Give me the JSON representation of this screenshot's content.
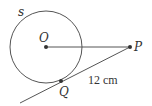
{
  "diagram": {
    "type": "geometry-tangent",
    "colors": {
      "stroke": "#555555",
      "point": "#333333",
      "text": "#333333",
      "background": "#ffffff"
    },
    "circle": {
      "label": "s",
      "center": [
        46,
        47
      ],
      "radius": 36
    },
    "points": {
      "O": {
        "label": "O",
        "x": 46,
        "y": 47
      },
      "P": {
        "label": "P",
        "x": 130,
        "y": 47
      },
      "Q": {
        "label": "Q",
        "x": 61,
        "y": 81
      }
    },
    "segments": [
      {
        "from": "O",
        "to": "P"
      },
      {
        "from": "P",
        "to": "Q",
        "extends_to": [
          20,
          103
        ]
      }
    ],
    "measurement": {
      "label": "12 cm",
      "segment": "PQ"
    }
  }
}
